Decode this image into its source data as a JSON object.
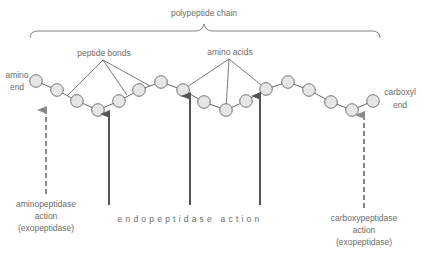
{
  "labels": {
    "chain": "polypeptide chain",
    "peptide_bonds": "peptide bonds",
    "amino_acids": "amino acids",
    "amino_end_line1": "amino",
    "amino_end_line2": "end",
    "carboxyl_end_line1": "carboxyl",
    "carboxyl_end_line2": "end",
    "aminopeptidase_line1": "aminopeptidase",
    "aminopeptidase_line2": "action",
    "aminopeptidase_line3": "(exopeptidase)",
    "endopeptidase": "endopeptidase action",
    "carboxypeptidase_line1": "carboxypeptidase",
    "carboxypeptidase_line2": "action",
    "carboxypeptidase_line3": "(exopeptidase)"
  },
  "chain": {
    "amino_acid_count": 17,
    "amino_acids": [
      {
        "x": 36,
        "y": 81
      },
      {
        "x": 57,
        "y": 90
      },
      {
        "x": 77,
        "y": 101
      },
      {
        "x": 98,
        "y": 110
      },
      {
        "x": 119,
        "y": 101
      },
      {
        "x": 139,
        "y": 90
      },
      {
        "x": 161,
        "y": 82
      },
      {
        "x": 183,
        "y": 90
      },
      {
        "x": 204,
        "y": 102
      },
      {
        "x": 226,
        "y": 110
      },
      {
        "x": 246,
        "y": 101
      },
      {
        "x": 266,
        "y": 89
      },
      {
        "x": 288,
        "y": 82
      },
      {
        "x": 309,
        "y": 90
      },
      {
        "x": 331,
        "y": 102
      },
      {
        "x": 352,
        "y": 110
      },
      {
        "x": 373,
        "y": 101
      }
    ],
    "radius": 6.3
  },
  "arrows": [
    {
      "name": "aminopeptidase",
      "style": "dashed",
      "x": 46,
      "tip_y": 109,
      "end_y": 194
    },
    {
      "name": "endopeptidase-1",
      "style": "solid",
      "x": 109,
      "tip_y": 113,
      "end_y": 205
    },
    {
      "name": "endopeptidase-2",
      "style": "solid",
      "x": 190,
      "tip_y": 95,
      "end_y": 205
    },
    {
      "name": "endopeptidase-3",
      "style": "solid",
      "x": 260,
      "tip_y": 95,
      "end_y": 205
    },
    {
      "name": "carboxypeptidase",
      "style": "dashed",
      "x": 364,
      "tip_y": 114,
      "end_y": 208
    }
  ],
  "colors": {
    "amino_acid_fill": "#e6e6e6",
    "amino_acid_stroke": "#666666",
    "text": "#6b6b6b",
    "solid_arrow": "#555555",
    "dashed_arrow": "#888888"
  }
}
